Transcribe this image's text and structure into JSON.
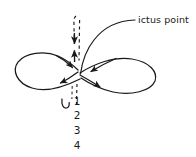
{
  "figure": {
    "background_color": "#ffffff",
    "stroke_color": "#1a1a1a",
    "annotations": {
      "ictus_label": "ictus point"
    },
    "beat_numbers": [
      "1",
      "2",
      "3",
      "4"
    ],
    "icons": {
      "leader_line": "leader-line-icon",
      "dashed_axis": "dashed-vertical-axis-icon",
      "arrow_down": "arrow-down-icon",
      "arrow_up": "arrow-up-icon",
      "left_loop": "left-loop-icon",
      "right_loop": "right-loop-icon",
      "rebound_hook": "rebound-hook-icon"
    }
  }
}
